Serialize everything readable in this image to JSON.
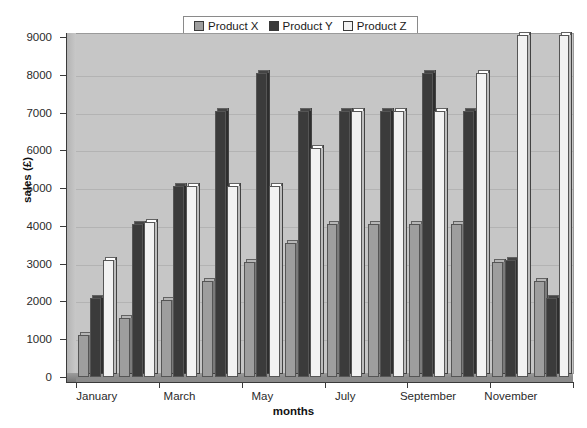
{
  "chart_data": {
    "type": "bar",
    "title": "",
    "xlabel": "months",
    "ylabel": "sales (£)",
    "ylim": [
      0,
      9000
    ],
    "ytick_step": 1000,
    "yticks": [
      0,
      1000,
      2000,
      3000,
      4000,
      5000,
      6000,
      7000,
      8000,
      9000
    ],
    "grid": true,
    "legend_position": "top-center",
    "categories": [
      "January",
      "February",
      "March",
      "April",
      "May",
      "June",
      "July",
      "August",
      "September",
      "October",
      "November",
      "December"
    ],
    "visible_tick_labels": [
      "January",
      "March",
      "May",
      "July",
      "September",
      "November"
    ],
    "series": [
      {
        "name": "Product X",
        "color": "#9e9e9e",
        "values": [
          1100,
          1550,
          2050,
          2550,
          3050,
          3550,
          4050,
          4050,
          4050,
          4050,
          3050,
          2550
        ]
      },
      {
        "name": "Product Y",
        "color": "#3b3b3b",
        "values": [
          2100,
          4050,
          5050,
          7050,
          8050,
          7050,
          7050,
          7050,
          8050,
          7050,
          3100,
          2100
        ]
      },
      {
        "name": "Product Z",
        "color": "#f2f2f2",
        "values": [
          3100,
          4100,
          5050,
          5050,
          5050,
          6050,
          7050,
          7050,
          7050,
          8050,
          9050,
          9050
        ]
      }
    ]
  },
  "colors": {
    "plot_background": "#c6c6c6",
    "page_background": "#ffffff",
    "axis": "#3a3a3a",
    "text": "#1a1a1a"
  }
}
